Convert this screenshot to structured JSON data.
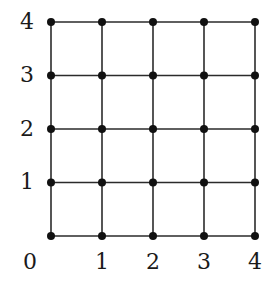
{
  "figure": {
    "title": "",
    "background_color": "#ffffff",
    "line_color": "#2b2b2b",
    "vertex_color": "#111111",
    "label_color": "#1a1a1a"
  },
  "chart_data": {
    "type": "scatter",
    "title": "",
    "xlabel": "",
    "ylabel": "",
    "xlim": [
      0,
      4
    ],
    "ylim": [
      0,
      4
    ],
    "grid": true,
    "legend": null,
    "x_ticks": [
      0,
      1,
      2,
      3,
      4
    ],
    "y_ticks": [
      0,
      1,
      2,
      3,
      4
    ],
    "x_tick_labels": [
      "0",
      "1",
      "2",
      "3",
      "4"
    ],
    "y_tick_labels": [
      "0",
      "1",
      "2",
      "3",
      "4"
    ],
    "vertices": [
      {
        "x": 0,
        "y": 0
      },
      {
        "x": 1,
        "y": 0
      },
      {
        "x": 2,
        "y": 0
      },
      {
        "x": 3,
        "y": 0
      },
      {
        "x": 4,
        "y": 0
      },
      {
        "x": 0,
        "y": 1
      },
      {
        "x": 1,
        "y": 1
      },
      {
        "x": 2,
        "y": 1
      },
      {
        "x": 3,
        "y": 1
      },
      {
        "x": 4,
        "y": 1
      },
      {
        "x": 0,
        "y": 2
      },
      {
        "x": 1,
        "y": 2
      },
      {
        "x": 2,
        "y": 2
      },
      {
        "x": 3,
        "y": 2
      },
      {
        "x": 4,
        "y": 2
      },
      {
        "x": 0,
        "y": 3
      },
      {
        "x": 1,
        "y": 3
      },
      {
        "x": 2,
        "y": 3
      },
      {
        "x": 3,
        "y": 3
      },
      {
        "x": 4,
        "y": 3
      },
      {
        "x": 0,
        "y": 4
      },
      {
        "x": 1,
        "y": 4
      },
      {
        "x": 2,
        "y": 4
      },
      {
        "x": 3,
        "y": 4
      },
      {
        "x": 4,
        "y": 4
      }
    ],
    "vertex_count": 25,
    "edge_count": 40,
    "rows": [
      0,
      1,
      2,
      3,
      4
    ],
    "cols": [
      0,
      1,
      2,
      3,
      4
    ]
  },
  "axes": {
    "y_labels": [
      {
        "text": "4",
        "value": 4
      },
      {
        "text": "3",
        "value": 3
      },
      {
        "text": "2",
        "value": 2
      },
      {
        "text": "1",
        "value": 1
      },
      {
        "text": "0",
        "value": 0
      }
    ],
    "x_labels": [
      {
        "text": "0",
        "value": 0
      },
      {
        "text": "1",
        "value": 1
      },
      {
        "text": "2",
        "value": 2
      },
      {
        "text": "3",
        "value": 3
      },
      {
        "text": "4",
        "value": 4
      }
    ]
  },
  "geometry": {
    "origin_px": {
      "x": 51,
      "y": 236
    },
    "step_x_px": 51,
    "step_y_px": 53.5,
    "vertex_radius_px": 4,
    "line_width_px": 1.6
  }
}
